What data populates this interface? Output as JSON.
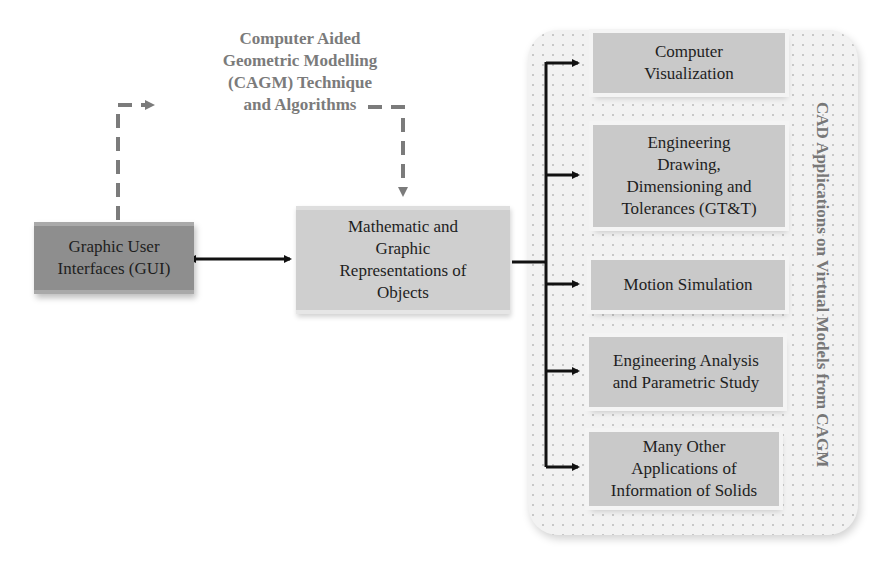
{
  "diagram": {
    "technique_label": "Computer Aided Geometric Modelling (CAGM) Technique and Algorithms",
    "technique_lines": [
      "Computer Aided",
      "Geometric Modelling",
      "(CAGM) Technique",
      "and Algorithms"
    ],
    "gui_box": {
      "lines": [
        "Graphic User",
        "Interfaces (GUI)"
      ]
    },
    "representation_box": {
      "lines": [
        "Mathematic and",
        "Graphic",
        "Representations of",
        "Objects"
      ]
    },
    "applications_panel": {
      "title": "CAD Applications on Virtual Models from CAGM",
      "items": [
        {
          "lines": [
            "Computer",
            "Visualization"
          ]
        },
        {
          "lines": [
            "Engineering",
            "Drawing,",
            "Dimensioning and",
            "Tolerances (GT&T)"
          ]
        },
        {
          "lines": [
            "Motion Simulation"
          ]
        },
        {
          "lines": [
            "Engineering Analysis",
            "and Parametric Study"
          ]
        },
        {
          "lines": [
            "Many Other",
            "Applications of",
            "Information of Solids"
          ]
        }
      ]
    },
    "colors": {
      "gui_fill": "#8e8e8e",
      "representation_fill": "#cfcfcf",
      "application_fill": "#c9c9c9",
      "dashed_arrow": "#7b7b7b",
      "solid_arrow": "#111111",
      "panel_fill": "#f2f2f2"
    }
  }
}
